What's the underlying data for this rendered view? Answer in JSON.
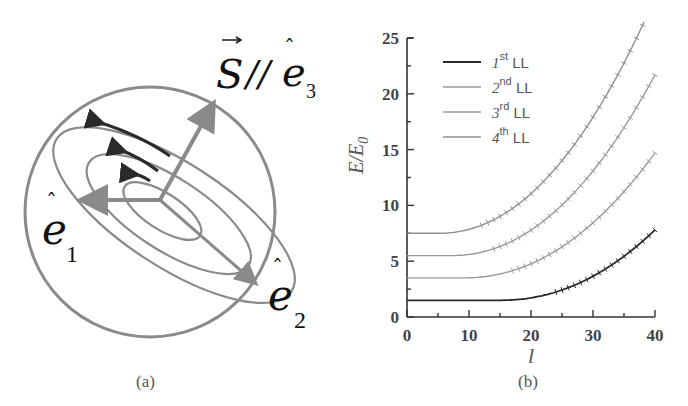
{
  "panels": {
    "a": {
      "label": "(a)",
      "annotations": {
        "s_label": "S",
        "parallel": "//",
        "e_hat": "e",
        "e3_sub": "3",
        "e1_sub": "1",
        "e2_sub": "2"
      }
    },
    "b": {
      "label": "(b)"
    }
  },
  "chart_data": [
    {
      "type": "diagram",
      "panel": "(a)",
      "description": "Sphere with three nested elliptical orbits tilted along e2 axis; arrows indicate circulation direction; vectors e1, e2 and S//e3 from center",
      "labels": [
        "S//ê3",
        "ê1",
        "ê2"
      ],
      "colors": {
        "stroke": "#8a8a8a",
        "arrows": "#333333"
      }
    },
    {
      "type": "line",
      "panel": "(b)",
      "title": "",
      "xlabel": "l",
      "ylabel": "E/E0",
      "xlim": [
        0,
        40
      ],
      "ylim": [
        0,
        25
      ],
      "xticks": [
        0,
        10,
        20,
        30,
        40
      ],
      "yticks": [
        0,
        5,
        10,
        15,
        20,
        25
      ],
      "grid": false,
      "legend_position": "upper-left",
      "legend": [
        "1st LL",
        "2nd LL",
        "3rd LL",
        "4th LL"
      ],
      "x": [
        0,
        5,
        10,
        15,
        20,
        25,
        30,
        35,
        40
      ],
      "series": [
        {
          "name": "1st LL",
          "color": "#2a2a2a",
          "values": [
            1.5,
            1.5,
            1.5,
            1.5,
            1.6,
            2.2,
            3.5,
            5.4,
            7.8
          ]
        },
        {
          "name": "2nd LL",
          "color": "#9a9a9a",
          "values": [
            3.5,
            3.5,
            3.5,
            3.7,
            4.5,
            6.0,
            8.3,
            11.2,
            14.7
          ]
        },
        {
          "name": "3rd LL",
          "color": "#9a9a9a",
          "values": [
            5.5,
            5.5,
            5.6,
            6.3,
            7.8,
            10.2,
            13.5,
            17.4,
            21.7
          ]
        },
        {
          "name": "4th LL",
          "color": "#8f8f8f",
          "values": [
            7.5,
            7.5,
            7.8,
            9.0,
            11.2,
            14.4,
            18.5,
            23.3,
            null
          ]
        },
        {
          "name": "4th LL (end)",
          "note": "4th LL reaches ~26.5 at l≈38 (exits top of plot)"
        }
      ]
    }
  ]
}
